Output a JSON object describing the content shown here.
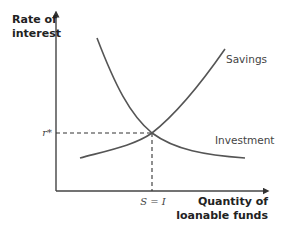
{
  "diagram": {
    "type": "loanable-funds-market",
    "y_axis_label_line1": "Rate of",
    "y_axis_label_line2": "interest",
    "x_axis_label_line1": "Quantity of",
    "x_axis_label_line2": "loanable funds",
    "curves": {
      "savings": {
        "label": "Savings",
        "slope": "upward"
      },
      "investment": {
        "label": "Investment",
        "slope": "downward"
      }
    },
    "equilibrium": {
      "rate_label": "r*",
      "quantity_label": "S = I"
    },
    "colors": {
      "axis": "#444444",
      "curve": "#555555",
      "text": "#222222"
    }
  }
}
